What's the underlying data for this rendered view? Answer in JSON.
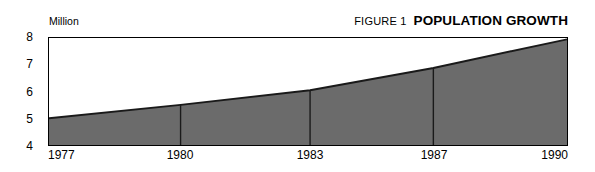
{
  "figure": {
    "kicker": "FIGURE 1",
    "title": "POPULATION GROWTH",
    "unit_label": "Million"
  },
  "colors": {
    "area_fill": "#6b6b6b",
    "area_edge": "#1a1a1a",
    "frame": "#000000",
    "gridline": "#1a1a1a",
    "background": "#ffffff"
  },
  "chart_data": {
    "type": "area",
    "title": "POPULATION GROWTH",
    "subtitle": "FIGURE 1",
    "xlabel": "",
    "ylabel": "Million",
    "x": [
      1977,
      1980,
      1983,
      1987,
      1990
    ],
    "categories": [
      "1977",
      "1980",
      "1983",
      "1987",
      "1990"
    ],
    "values": [
      5.0,
      5.5,
      6.05,
      6.88,
      7.95
    ],
    "series": [
      {
        "name": "Population",
        "values": [
          5.0,
          5.5,
          6.05,
          6.88,
          7.95
        ]
      }
    ],
    "ylim": [
      4,
      8
    ],
    "yticks": [
      8,
      7,
      6,
      5,
      4
    ],
    "ytick_labels": [
      "8",
      "7",
      "6",
      "5",
      "4"
    ],
    "xtick_labels": [
      "1977",
      "1980",
      "1983",
      "1987",
      "1990"
    ],
    "xtick_positions_pct": [
      0,
      25.4,
      50.4,
      74.2,
      100
    ],
    "gridlines_x_pct": [
      25.4,
      50.4,
      74.2
    ],
    "grid": "vertical-only",
    "legend": "none"
  }
}
